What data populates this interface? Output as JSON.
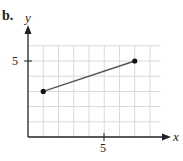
{
  "part_label": "b.",
  "chart_data": {
    "type": "line",
    "title": "",
    "xlabel": "x",
    "ylabel": "y",
    "x": [
      1,
      7
    ],
    "series": [
      {
        "name": "segment",
        "values": [
          3,
          5
        ],
        "points": [
          [
            1,
            3
          ],
          [
            7,
            5
          ]
        ],
        "color": "#555555"
      }
    ],
    "xlim": [
      0,
      9
    ],
    "ylim": [
      0,
      6
    ],
    "x_ticks_labeled": [
      5
    ],
    "y_ticks_labeled": [
      5
    ],
    "grid": true,
    "legend": null
  },
  "axes": {
    "x_label": "x",
    "y_label": "y",
    "x_tick_label": "5",
    "y_tick_label": "5"
  },
  "colors": {
    "grid": "#d9d9d9",
    "axis": "#222222",
    "line": "#555555",
    "point": "#111111"
  }
}
